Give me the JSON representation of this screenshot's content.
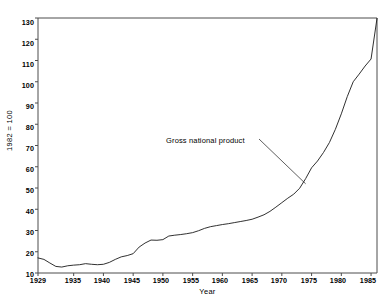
{
  "figure": {
    "title_visible_fragment": "",
    "xlabel": "Year",
    "ylabel": "1982 = 100"
  },
  "annotation": {
    "label": "Gross national product"
  },
  "axis": {
    "y_ticks": [
      "10",
      "20",
      "30",
      "40",
      "50",
      "60",
      "70",
      "80",
      "90",
      "100",
      "110",
      "120",
      "130"
    ],
    "x_ticks": [
      "1929",
      "1935",
      "1940",
      "1945",
      "1950",
      "1955",
      "1960",
      "1965",
      "1970",
      "1975",
      "1980",
      "1985"
    ]
  },
  "colors": {
    "line": "#1a1a1a",
    "frame": "#4d4d4d",
    "background": "#ffffff",
    "text": "#000000"
  },
  "chart_data": {
    "type": "line",
    "xlabel": "Year",
    "ylabel": "1982 = 100",
    "xlim": [
      1929,
      1986
    ],
    "ylim": [
      10,
      130
    ],
    "grid": false,
    "legend": "annotation",
    "series": [
      {
        "name": "Gross national product",
        "x": [
          1929,
          1930,
          1931,
          1932,
          1933,
          1934,
          1935,
          1936,
          1937,
          1938,
          1939,
          1940,
          1941,
          1942,
          1943,
          1944,
          1945,
          1946,
          1947,
          1948,
          1949,
          1950,
          1951,
          1952,
          1953,
          1954,
          1955,
          1956,
          1957,
          1958,
          1959,
          1960,
          1961,
          1962,
          1963,
          1964,
          1965,
          1966,
          1967,
          1968,
          1969,
          1970,
          1971,
          1972,
          1973,
          1974,
          1975,
          1976,
          1977,
          1978,
          1979,
          1980,
          1981,
          1982,
          1983,
          1984,
          1985,
          1986
        ],
        "y": [
          17.1,
          16.4,
          14.7,
          13.1,
          12.8,
          13.4,
          13.7,
          13.9,
          14.4,
          14.1,
          13.9,
          14.1,
          15.0,
          16.4,
          17.6,
          18.2,
          19.1,
          22.2,
          24.1,
          25.5,
          25.4,
          25.7,
          27.4,
          27.8,
          28.1,
          28.5,
          29.0,
          29.9,
          31.0,
          31.8,
          32.3,
          32.8,
          33.2,
          33.7,
          34.2,
          34.7,
          35.3,
          36.3,
          37.4,
          39.0,
          41.0,
          43.1,
          45.2,
          47.1,
          49.9,
          54.4,
          59.5,
          62.7,
          66.7,
          71.4,
          77.6,
          84.9,
          93.0,
          100.0,
          103.6,
          107.4,
          110.7,
          129.8
        ]
      }
    ],
    "annotations": [
      {
        "text": "Gross national product",
        "points_to_x": 1974,
        "points_to_y": 52
      }
    ]
  }
}
